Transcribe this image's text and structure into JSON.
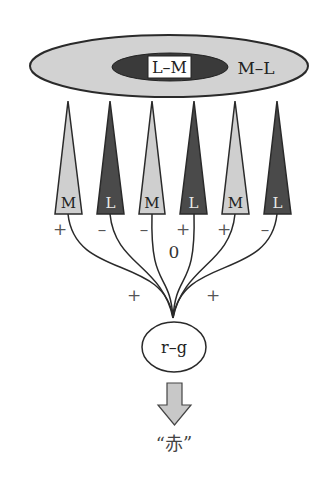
{
  "diagram": {
    "receptive_field": {
      "surround_label": "M–L",
      "center_label": "L–M"
    },
    "cones": [
      {
        "type": "M",
        "sign": "+"
      },
      {
        "type": "L",
        "sign": "–"
      },
      {
        "type": "M",
        "sign": "–"
      },
      {
        "type": "L",
        "sign": "+"
      },
      {
        "type": "M",
        "sign": "+"
      },
      {
        "type": "L",
        "sign": "–"
      }
    ],
    "center_weight_label": "0",
    "lower_signs": [
      "+",
      "+"
    ],
    "cell_label": "r–g",
    "output_label": "“赤”"
  },
  "colors": {
    "surround_fill": "#d2d2d2",
    "center_fill": "#3a3a3a",
    "m_cone_fill": "#cfcfcf",
    "l_cone_fill": "#4a4a4a",
    "stroke": "#2a2a2a",
    "sign_color": "#555555",
    "arrow_fill": "#c8c8c8"
  }
}
